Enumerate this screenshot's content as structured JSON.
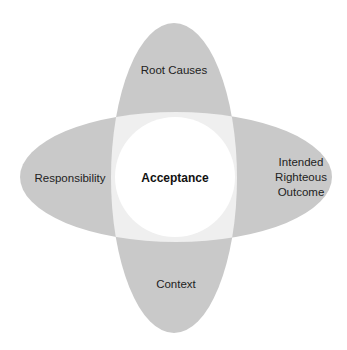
{
  "diagram": {
    "center": {
      "label": "Acceptance"
    },
    "petals": {
      "top": {
        "label": "Root Causes"
      },
      "left": {
        "label": "Responsibility"
      },
      "right": {
        "lines": [
          "Intended",
          "Righteous",
          "Outcome"
        ]
      },
      "bottom": {
        "label": "Context"
      }
    },
    "colors": {
      "petal": "#c9c9c9",
      "overlap": "#efefef",
      "center": "#ffffff",
      "text": "#222222"
    }
  }
}
